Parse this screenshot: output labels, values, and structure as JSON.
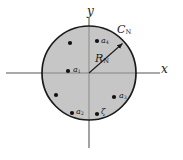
{
  "figure": {
    "kind": "complex-plane-contour-diagram",
    "background_color": "#ffffff",
    "disk_fill_color": "#c6c6c6",
    "stroke_color": "#1a1a1a",
    "axis_color": "#8c8c8c",
    "axes": {
      "x_label": "x",
      "y_label": "y",
      "x_axis_start_x": 6,
      "x_axis_end_x": 160,
      "y_axis_start_y": 18,
      "y_axis_end_y": 148,
      "origin_x": 89,
      "origin_y": 73
    },
    "contour": {
      "label": "C",
      "label_sub": "N",
      "center_x": 89,
      "center_y": 73,
      "radius": 47
    },
    "radius_annotation": {
      "label": "R",
      "label_sub": "N",
      "from_x": 89,
      "from_y": 73,
      "to_x": 124,
      "to_y": 42
    },
    "points": [
      {
        "label": "",
        "label_sub": "",
        "x": 70,
        "y": 43,
        "labeled": false
      },
      {
        "label": "a",
        "label_sub": "4",
        "x": 97,
        "y": 41,
        "labeled": true
      },
      {
        "label": "a",
        "label_sub": "1",
        "x": 68,
        "y": 71,
        "labeled": true
      },
      {
        "label": "",
        "label_sub": "",
        "x": 56,
        "y": 95,
        "labeled": false
      },
      {
        "label": "a",
        "label_sub": "2",
        "x": 72,
        "y": 113,
        "labeled": true
      },
      {
        "label": "a",
        "label_sub": "3",
        "x": 114,
        "y": 97,
        "labeled": true
      },
      {
        "label": "ζ",
        "label_sub": "",
        "x": 97,
        "y": 114,
        "labeled": true
      }
    ]
  }
}
